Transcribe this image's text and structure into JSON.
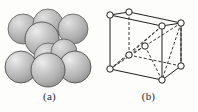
{
  "figure": {
    "background_color": "#fdfdfc",
    "width": 198,
    "height": 112
  },
  "panels": [
    {
      "id": "panel-a",
      "caption": "(a)",
      "kind": "hard-sphere-packing-model",
      "description": "Body-centered cubic hard-sphere reduced unit cell: nine overlapping shaded spheres in two layers",
      "sphere_color": "#bfbfbf",
      "sphere_highlight_color": "#e8e8e8",
      "sphere_shadow_color": "#8f8f8f",
      "sphere_outline_color": "#555555",
      "sphere_count": 9,
      "spheres": [
        {
          "name": "back-top-left",
          "cx": 23,
          "cy": 29,
          "r": 15
        },
        {
          "name": "back-top-center",
          "cx": 48,
          "cy": 24,
          "r": 15
        },
        {
          "name": "back-top-right",
          "cx": 73,
          "cy": 29,
          "r": 15
        },
        {
          "name": "front-top-center",
          "cx": 42,
          "cy": 39,
          "r": 17
        },
        {
          "name": "body-center",
          "cx": 62,
          "cy": 52,
          "r": 13
        },
        {
          "name": "back-bottom-center",
          "cx": 48,
          "cy": 57,
          "r": 14
        },
        {
          "name": "front-bottom-left",
          "cx": 21,
          "cy": 67,
          "r": 16
        },
        {
          "name": "front-bottom-center",
          "cx": 48,
          "cy": 70,
          "r": 17
        },
        {
          "name": "front-bottom-right",
          "cx": 75,
          "cy": 67,
          "r": 16
        }
      ]
    },
    {
      "id": "panel-b",
      "caption": "(b)",
      "kind": "reduced-sphere-unit-cell-wireframe",
      "description": "Body-centered cubic unit cell drawn in perspective with open-circle atoms at the eight cube corners and one at the body centre; dashed lines mark hidden edges and body-diagonal bonds",
      "line_color": "#1f1f1f",
      "atom_fill_color": "#ffffff",
      "atom_outline_color": "#1f1f1f",
      "atom_radius": 3.2,
      "atom_count": 9,
      "atoms": [
        {
          "name": "front-bottom-left",
          "x": 11,
          "y": 69,
          "hidden": false
        },
        {
          "name": "front-bottom-right",
          "x": 63,
          "y": 80,
          "hidden": false
        },
        {
          "name": "front-top-left",
          "x": 11,
          "y": 15,
          "hidden": false
        },
        {
          "name": "front-top-right",
          "x": 63,
          "y": 26,
          "hidden": false
        },
        {
          "name": "back-bottom-left",
          "x": 30,
          "y": 55,
          "hidden": true
        },
        {
          "name": "back-bottom-right",
          "x": 82,
          "y": 66,
          "hidden": false
        },
        {
          "name": "back-top-left",
          "x": 30,
          "y": 12,
          "hidden": false
        },
        {
          "name": "back-top-right",
          "x": 82,
          "y": 23,
          "hidden": false
        },
        {
          "name": "body-center",
          "x": 46,
          "y": 46,
          "hidden": true
        }
      ],
      "solid_edges": [
        "front-top-left → front-top-right",
        "front-top-left → front-bottom-left",
        "front-top-right → front-bottom-right",
        "front-bottom-left → front-bottom-right",
        "front-top-left → back-top-left",
        "front-top-right → back-top-right",
        "back-top-left → back-top-right",
        "back-top-right → back-bottom-right",
        "front-bottom-right → back-bottom-right"
      ],
      "dashed_edges": [
        "back-bottom-left → back-bottom-right",
        "back-bottom-left → back-top-left",
        "back-bottom-left → front-bottom-left",
        "body-center → back-top-right",
        "body-center → front-bottom-left",
        "body-center → front-bottom-right",
        "body-center → back-bottom-left"
      ],
      "dash_pattern": "3 2"
    }
  ]
}
